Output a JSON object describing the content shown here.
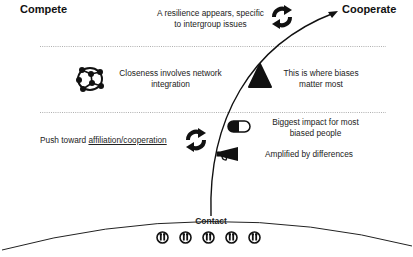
{
  "diagram": {
    "left_pole": "Compete",
    "right_pole": "Cooperate",
    "base_label": "Contact",
    "contact_icons": [
      "person-pair-icon",
      "person-pair-icon",
      "person-pair-icon",
      "person-pair-icon",
      "person-pair-icon"
    ],
    "items": [
      {
        "icon": "cycle-arrows-icon",
        "text_line1": "A resilience appears, specific",
        "text_line2": "to intergroup issues"
      },
      {
        "icon": "network-icon",
        "text_line1": "Closeness involves network",
        "text_line2": "integration"
      },
      {
        "icon": "warning-triangle-icon",
        "text_line1": "This is where biases",
        "text_line2": "matter most"
      },
      {
        "icon": "cycle-arrows-icon",
        "text_prefix": "Push toward ",
        "text_underlined": "affiliation/cooperation"
      },
      {
        "icon": "pill-toggle-icon",
        "text_line1": "Biggest impact for most",
        "text_line2": "biased people"
      },
      {
        "icon": "megaphone-icon",
        "text_line1": "Amplified by differences"
      }
    ],
    "colors": {
      "ink": "#111111",
      "divider": "#9a9a9a",
      "background": "#ffffff"
    }
  }
}
